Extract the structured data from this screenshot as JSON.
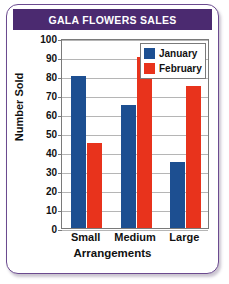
{
  "card": {
    "title": "GALA FLOWERS SALES",
    "banner_color": "#4b2a70",
    "border_color": "#6b4a8f"
  },
  "chart_data": {
    "type": "bar",
    "title": "GALA FLOWERS SALES",
    "xlabel": "Arrangements",
    "ylabel": "Number Sold",
    "categories": [
      "Small",
      "Medium",
      "Large"
    ],
    "series": [
      {
        "name": "January",
        "color": "#1d4f91",
        "values": [
          80,
          65,
          35
        ]
      },
      {
        "name": "February",
        "color": "#e8331c",
        "values": [
          45,
          90,
          75
        ]
      }
    ],
    "ylim": [
      0,
      100
    ],
    "ytick_step": 10,
    "yticks": [
      100,
      90,
      80,
      70,
      60,
      50,
      40,
      30,
      20,
      10,
      0
    ],
    "grid": true,
    "legend_position": "top-right"
  }
}
